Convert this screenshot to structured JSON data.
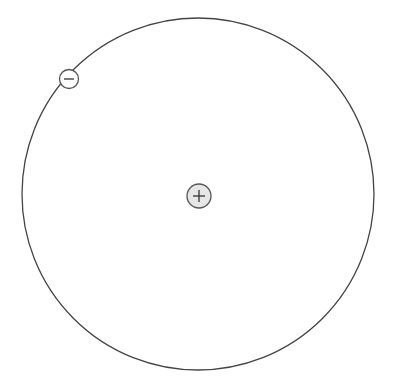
{
  "diagram": {
    "nucleus": {
      "label": "+",
      "charge": "positive",
      "fill": "#e6e6e6",
      "stroke": "#555555"
    },
    "electron": {
      "label": "−",
      "charge": "negative",
      "fill": "#ffffff",
      "stroke": "#555555"
    },
    "orbit": {
      "stroke": "#444444"
    },
    "background": "#ffffff"
  }
}
